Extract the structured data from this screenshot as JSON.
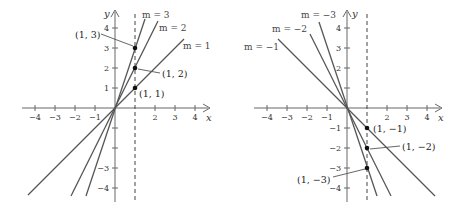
{
  "figure": {
    "left_panel": {
      "x_axis_label": "x",
      "y_axis_label": "y",
      "x_ticks": [
        "−4",
        "−3",
        "−2",
        "−1",
        "2",
        "3",
        "4"
      ],
      "y_ticks_pos": [
        "1",
        "2",
        "3",
        "4"
      ],
      "y_ticks_neg": [
        "−3",
        "−4"
      ],
      "lines": [
        {
          "label": "m = 3",
          "slope": 3
        },
        {
          "label": "m = 2",
          "slope": 2
        },
        {
          "label": "m = 1",
          "slope": 1
        }
      ],
      "points": [
        {
          "label": "(1, 3)",
          "x": 1,
          "y": 3
        },
        {
          "label": "(1, 2)",
          "x": 1,
          "y": 2
        },
        {
          "label": "(1, 1)",
          "x": 1,
          "y": 1
        }
      ],
      "vertical_dashed_line_x": 1
    },
    "right_panel": {
      "x_axis_label": "x",
      "y_axis_label": "y",
      "x_ticks": [
        "−4",
        "−3",
        "−2",
        "−1",
        "2",
        "3",
        "4"
      ],
      "y_ticks_pos": [
        "2",
        "3",
        "4"
      ],
      "y_ticks_neg": [
        "−1",
        "−2",
        "−3",
        "−4"
      ],
      "lines": [
        {
          "label": "m = −3",
          "slope": -3
        },
        {
          "label": "m = −2",
          "slope": -2
        },
        {
          "label": "m = −1",
          "slope": -1
        }
      ],
      "points": [
        {
          "label": "(1, −1)",
          "x": 1,
          "y": -1
        },
        {
          "label": "(1, −2)",
          "x": 1,
          "y": -2
        },
        {
          "label": "(1, −3)",
          "x": 1,
          "y": -3
        }
      ],
      "vertical_dashed_line_x": 1
    }
  },
  "colors": {
    "axis": "#555555",
    "line": "#555555",
    "point": "#111111",
    "dashed": "#444444"
  }
}
